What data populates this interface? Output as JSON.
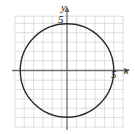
{
  "figure": {
    "width": 135,
    "height": 134,
    "background": "#ffffff"
  },
  "axes": {
    "x": {
      "name": "x",
      "tick_label": "5",
      "arrow": "right"
    },
    "y": {
      "name": "y",
      "tick_label": "5",
      "arrow": "up"
    },
    "origin_px": {
      "x": 67,
      "y": 70.5
    },
    "unit_px": 9.35,
    "axis_color": "#6e6e6e",
    "grid_color": "#c9c9c9"
  },
  "chart_data": {
    "type": "scatter",
    "title": "",
    "xlabel": "x",
    "ylabel": "y",
    "grid": true,
    "legend": null,
    "xlim": [
      -7,
      7
    ],
    "ylim": [
      -6.8,
      6.8
    ],
    "xticks": [
      5
    ],
    "yticks": [
      5
    ],
    "xticklabels": [
      "5"
    ],
    "yticklabels": [
      "5"
    ],
    "series": [
      {
        "name": "circle",
        "kind": "circle",
        "equation": "x^2 + y^2 = 25",
        "center": [
          0,
          0
        ],
        "radius": 5,
        "color": "#2b2b2b",
        "linewidth": 1.4
      }
    ]
  }
}
